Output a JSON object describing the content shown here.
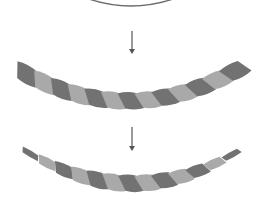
{
  "diagram": {
    "colors": {
      "background": "#ffffff",
      "strand_dark": "#727272",
      "strand_light": "#a9a9a9",
      "arc_stroke": "#6a6a6a",
      "arrow": "#555555"
    },
    "stages": [
      {
        "id": "profile-arc",
        "type": "arc"
      },
      {
        "id": "twisted-rope",
        "type": "rope",
        "strands": 13,
        "tapered": false
      },
      {
        "id": "tapered-rope",
        "type": "rope",
        "strands": 13,
        "tapered": true
      }
    ],
    "arrows": [
      {
        "id": "arrow-1",
        "x": 132,
        "y1": 31,
        "y2": 54
      },
      {
        "id": "arrow-2",
        "x": 132,
        "y1": 127,
        "y2": 151
      }
    ],
    "rope1": {
      "x0": 18,
      "y0": 70,
      "x1": 244,
      "y1": 66,
      "sag": 33,
      "strands": 13,
      "width0": 15,
      "width1": 15,
      "taper": false
    },
    "rope2": {
      "x0": 22,
      "y0": 149,
      "x1": 240,
      "y1": 150,
      "sag": 34,
      "strands": 13,
      "width0": 3,
      "width1": 15,
      "taper": true
    }
  }
}
